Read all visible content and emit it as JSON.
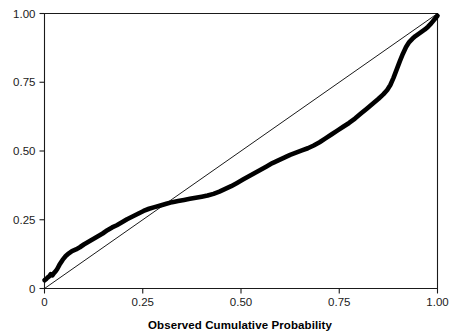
{
  "chart_data": {
    "type": "line",
    "title": "",
    "subtitle": "",
    "xlabel": "Observed Cumulative Probability",
    "ylabel": "",
    "xlim": [
      0,
      1
    ],
    "ylim": [
      0,
      1
    ],
    "grid": false,
    "legend": null,
    "x_ticks": [
      0,
      0.25,
      0.5,
      0.75,
      1
    ],
    "x_tick_labels": [
      "0",
      "0.25",
      "0.50",
      "0.75",
      "1.00"
    ],
    "y_ticks": [
      0,
      0.25,
      0.5,
      0.75,
      1
    ],
    "y_tick_labels": [
      "0",
      "0.25",
      "0.50",
      "0.75",
      "1.00"
    ],
    "series": [
      {
        "name": "reference-line",
        "style": "thin-diagonal",
        "color": "#000000",
        "x": [
          0,
          1
        ],
        "values": [
          0,
          1
        ]
      },
      {
        "name": "expected-cumulative-probability",
        "style": "thick-step-curve",
        "color": "#000000",
        "x": [
          0.0,
          0.004,
          0.008,
          0.012,
          0.016,
          0.02,
          0.024,
          0.028,
          0.032,
          0.038,
          0.046,
          0.054,
          0.062,
          0.07,
          0.08,
          0.09,
          0.1,
          0.112,
          0.124,
          0.136,
          0.148,
          0.16,
          0.172,
          0.184,
          0.196,
          0.21,
          0.224,
          0.238,
          0.252,
          0.266,
          0.28,
          0.295,
          0.31,
          0.325,
          0.34,
          0.355,
          0.37,
          0.385,
          0.4,
          0.415,
          0.43,
          0.445,
          0.46,
          0.475,
          0.49,
          0.505,
          0.52,
          0.535,
          0.55,
          0.565,
          0.58,
          0.595,
          0.61,
          0.625,
          0.64,
          0.655,
          0.67,
          0.685,
          0.7,
          0.715,
          0.73,
          0.745,
          0.76,
          0.775,
          0.79,
          0.805,
          0.82,
          0.835,
          0.85,
          0.862,
          0.872,
          0.88,
          0.888,
          0.896,
          0.904,
          0.912,
          0.92,
          0.928,
          0.936,
          0.944,
          0.952,
          0.96,
          0.968,
          0.976,
          0.984,
          0.992,
          1.0
        ],
        "values": [
          0.03,
          0.034,
          0.04,
          0.044,
          0.052,
          0.048,
          0.056,
          0.062,
          0.07,
          0.086,
          0.104,
          0.118,
          0.128,
          0.136,
          0.142,
          0.15,
          0.16,
          0.17,
          0.18,
          0.19,
          0.2,
          0.212,
          0.222,
          0.23,
          0.24,
          0.252,
          0.262,
          0.272,
          0.282,
          0.29,
          0.296,
          0.302,
          0.308,
          0.314,
          0.318,
          0.322,
          0.326,
          0.33,
          0.334,
          0.338,
          0.344,
          0.352,
          0.362,
          0.372,
          0.384,
          0.396,
          0.408,
          0.42,
          0.432,
          0.444,
          0.456,
          0.466,
          0.476,
          0.486,
          0.494,
          0.502,
          0.51,
          0.52,
          0.532,
          0.546,
          0.56,
          0.574,
          0.588,
          0.602,
          0.618,
          0.636,
          0.654,
          0.672,
          0.69,
          0.706,
          0.722,
          0.74,
          0.766,
          0.796,
          0.826,
          0.854,
          0.878,
          0.896,
          0.908,
          0.918,
          0.926,
          0.934,
          0.942,
          0.952,
          0.964,
          0.978,
          0.992
        ]
      }
    ]
  },
  "axes": {
    "x_title": "Observed Cumulative Probability"
  }
}
